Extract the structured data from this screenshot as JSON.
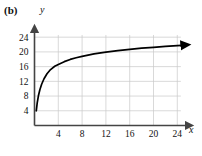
{
  "figure": {
    "panel_label": "(b)",
    "background_color": "#ffffff",
    "grid_color": "#c9c9c9",
    "axis_color": "#444444",
    "curve_color": "#000000"
  },
  "chart_data": {
    "type": "line",
    "title": "",
    "subtitle": "",
    "xlabel": "x",
    "ylabel": "y",
    "xlim": [
      0,
      25.5
    ],
    "ylim": [
      0,
      25.5
    ],
    "xticks": [
      4,
      8,
      12,
      16,
      20,
      24
    ],
    "yticks": [
      4,
      8,
      12,
      16,
      20,
      24
    ],
    "xticklabels": [
      "4",
      "8",
      "12",
      "16",
      "20",
      "24"
    ],
    "yticklabels": [
      "4",
      "8",
      "12",
      "16",
      "20",
      "24"
    ],
    "grid": true,
    "grid_spacing": 4,
    "legend": null,
    "legend_position": "none",
    "annotations": [],
    "series": [
      {
        "name": "logarithmic curve",
        "style": "solid",
        "arrow_end": true,
        "x": [
          0.3,
          0.45,
          0.65,
          0.9,
          1.2,
          1.6,
          2.1,
          2.7,
          3.4,
          4.0,
          5.0,
          6.0,
          7.0,
          8.0,
          10.0,
          12.0,
          14.0,
          16.0,
          18.0,
          20.0,
          22.0,
          24.0,
          24.8
        ],
        "y": [
          4.0,
          6.1,
          8.0,
          9.7,
          11.2,
          12.7,
          14.05,
          15.2,
          16.1,
          16.6,
          17.35,
          17.95,
          18.4,
          18.8,
          19.45,
          19.95,
          20.35,
          20.7,
          21.0,
          21.25,
          21.5,
          21.7,
          21.8
        ]
      }
    ]
  }
}
